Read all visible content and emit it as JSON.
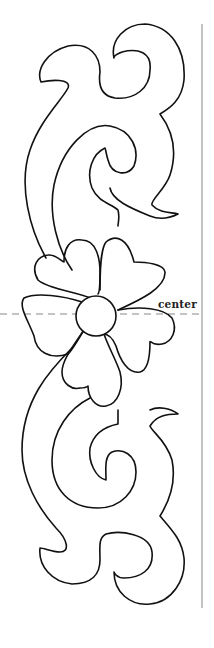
{
  "pattern": {
    "center_label": "center",
    "stroke_color": "#111111",
    "guide_color": "#888888",
    "background": "#ffffff"
  }
}
